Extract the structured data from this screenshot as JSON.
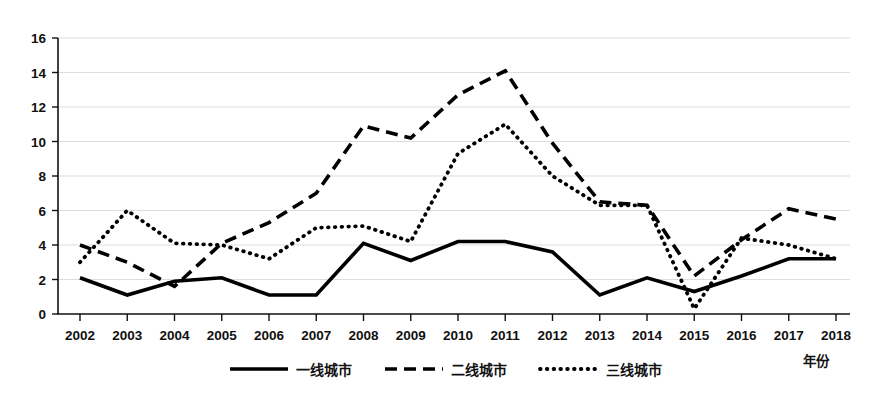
{
  "chart_data": {
    "type": "line",
    "title": "",
    "xlabel": "年份",
    "ylabel": "",
    "grid": true,
    "legend_position": "bottom",
    "xlim": [
      2002,
      2018
    ],
    "ylim": [
      0,
      16
    ],
    "y_ticks": [
      "0",
      "2",
      "4",
      "6",
      "8",
      "10",
      "12",
      "14",
      "16"
    ],
    "categories": [
      "2002",
      "2003",
      "2004",
      "2005",
      "2006",
      "2007",
      "2008",
      "2009",
      "2010",
      "2011",
      "2012",
      "2013",
      "2014",
      "2015",
      "2016",
      "2017",
      "2018"
    ],
    "series": [
      {
        "name": "一线城市",
        "style": "solid",
        "color": "#000000",
        "values": [
          2.1,
          1.1,
          1.9,
          2.1,
          1.1,
          1.1,
          4.1,
          3.1,
          4.2,
          4.2,
          3.6,
          1.1,
          2.1,
          1.3,
          2.2,
          3.2,
          3.2
        ]
      },
      {
        "name": "二线城市",
        "style": "dashed",
        "color": "#000000",
        "values": [
          4.0,
          3.0,
          1.6,
          4.1,
          5.3,
          7.0,
          10.9,
          10.2,
          12.7,
          14.1,
          9.9,
          6.5,
          6.3,
          2.2,
          4.3,
          6.1,
          5.5
        ]
      },
      {
        "name": "三线城市",
        "style": "dotted",
        "color": "#000000",
        "values": [
          3.0,
          6.0,
          4.1,
          4.0,
          3.2,
          5.0,
          5.1,
          4.2,
          9.3,
          11.0,
          8.0,
          6.3,
          6.3,
          0.3,
          4.4,
          4.0,
          3.2
        ]
      }
    ]
  },
  "legend": {
    "items": [
      {
        "label": "一线城市",
        "marker": "solid-line-swatch"
      },
      {
        "label": "二线城市",
        "marker": "dashed-line-swatch"
      },
      {
        "label": "三线城市",
        "marker": "dotted-line-swatch"
      }
    ]
  },
  "axis": {
    "x_axis_title": "年份"
  }
}
